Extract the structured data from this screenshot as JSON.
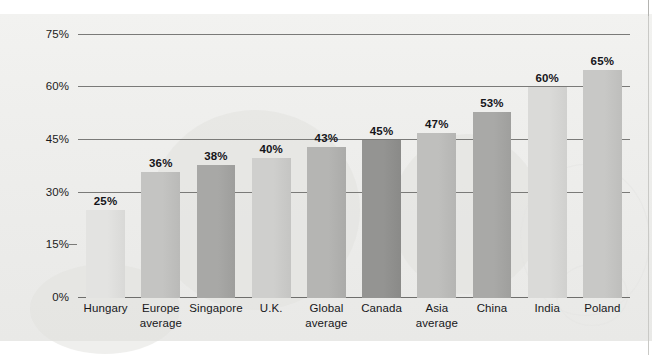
{
  "chart_data": {
    "type": "bar",
    "title": "",
    "subtitle": "",
    "xlabel": "",
    "ylabel": "",
    "ylim": [
      0,
      78
    ],
    "grid": true,
    "legend": "none",
    "orientation": "vertical",
    "value_label_format": "{v}%",
    "ytick_labels": [
      "0%",
      "15%",
      "30%",
      "45%",
      "60%",
      "75%"
    ],
    "ytick_values": [
      0,
      15,
      30,
      45,
      60,
      75
    ],
    "categories": [
      "Hungary",
      "Europe average",
      "Singapore",
      "U.K.",
      "Global average",
      "Canada",
      "Asia average",
      "China",
      "India",
      "Poland"
    ],
    "category_lines": [
      [
        "Hungary",
        ""
      ],
      [
        "Europe",
        "average"
      ],
      [
        "Singapore",
        ""
      ],
      [
        "U.K.",
        ""
      ],
      [
        "Global",
        "average"
      ],
      [
        "Canada",
        ""
      ],
      [
        "Asia",
        "average"
      ],
      [
        "China",
        ""
      ],
      [
        "India",
        ""
      ],
      [
        "Poland",
        ""
      ]
    ],
    "values": [
      25,
      36,
      38,
      40,
      43,
      45,
      47,
      53,
      60,
      65
    ],
    "value_labels": [
      "25%",
      "36%",
      "38%",
      "40%",
      "43%",
      "45%",
      "47%",
      "53%",
      "60%",
      "65%"
    ],
    "bar_colors": [
      "#e3e3e1",
      "#c4c4c2",
      "#a8a8a6",
      "#cfcfcd",
      "#b5b5b3",
      "#949492",
      "#bfbfbd",
      "#a9a9a7",
      "#dadad8",
      "#c8c8c6"
    ]
  },
  "colors": {
    "paper": "#eeeeec",
    "gridline": "#7a7a78",
    "text": "#17171a",
    "value_text": "#15151a"
  }
}
